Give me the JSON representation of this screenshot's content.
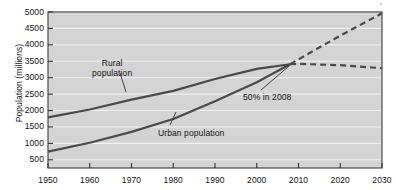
{
  "chart_data": {
    "type": "line",
    "title": "",
    "xlabel": "",
    "ylabel": "Population (millions)",
    "xlim": [
      1950,
      2030
    ],
    "ylim": [
      250,
      5000
    ],
    "grid": true,
    "legend": "none",
    "x_ticks": [
      1950,
      1960,
      1970,
      1980,
      1990,
      2000,
      2010,
      2020,
      2030
    ],
    "y_ticks": [
      500,
      1000,
      1500,
      2000,
      2500,
      3000,
      3500,
      4000,
      4500,
      5000
    ],
    "x_tick_labels": [
      "1950",
      "1960",
      "1970",
      "1980",
      "1990",
      "2000",
      "2010",
      "2020",
      "2030"
    ],
    "y_tick_labels": [
      "500",
      "1000",
      "1500",
      "2000",
      "2500",
      "3000",
      "3500",
      "4000",
      "4500",
      "5000"
    ],
    "x": [
      1950,
      1960,
      1970,
      1980,
      1990,
      2000,
      2008,
      2010,
      2020,
      2030
    ],
    "series": [
      {
        "name": "Rural population",
        "values": [
          1790,
          2030,
          2330,
          2600,
          2960,
          3270,
          3410,
          3420,
          3380,
          3290
        ],
        "solid_until": 2008,
        "style_solid": "solid",
        "style_after": "dashed",
        "color": "#4a4a4a"
      },
      {
        "name": "Urban population",
        "values": [
          750,
          1020,
          1350,
          1740,
          2280,
          2860,
          3410,
          3560,
          4280,
          4960
        ],
        "solid_until": 2008,
        "style_solid": "solid",
        "style_after": "dashed",
        "color": "#4a4a4a"
      }
    ],
    "annotations": [
      {
        "id": "crossover",
        "text": "50% in 2008",
        "x": 2008,
        "y": 3410
      },
      {
        "id": "rural-label",
        "text_line1": "Rural",
        "text_line2": "population",
        "x": 1966,
        "y": 2300
      },
      {
        "id": "urban-label",
        "text": "Urban population",
        "x": 1984,
        "y": 1800
      }
    ],
    "colors": {
      "plot_background": "#d4d4d4",
      "gridline": "#f2f2f2",
      "line": "#4a4a4a",
      "axis": "#3c3c3c",
      "text": "#111111",
      "page_background": "#ffffff"
    }
  },
  "labels": {
    "ylabel": "Population (millions)",
    "annot_rural_line1": "Rural",
    "annot_rural_line2": "population",
    "annot_urban": "Urban population",
    "annot_crossover": "50% in 2008"
  }
}
